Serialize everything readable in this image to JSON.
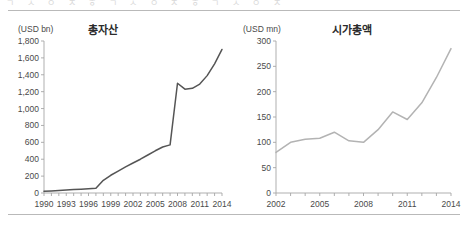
{
  "page": {
    "ghost_top_text": "ㄱ ㅅ ㅇ ㅈ ㅎ ㄱ ㅅ ㅇ ㅈ ㅎ ㄱ ㅅ ㅇ ㅈ"
  },
  "chart_data": [
    {
      "type": "line",
      "title": "총자산",
      "unit_label": "(USD bn)",
      "xlabel": "",
      "ylabel": "",
      "ylim": [
        0,
        1800
      ],
      "yticks": [
        0,
        200,
        400,
        600,
        800,
        1000,
        1200,
        1400,
        1600,
        1800
      ],
      "ytick_labels": [
        "0",
        "200",
        "400",
        "600",
        "800",
        "1,000",
        "1,200",
        "1,400",
        "1,600",
        "1,800"
      ],
      "xlim": [
        1990,
        2014
      ],
      "xticks": [
        1990,
        1993,
        1996,
        1999,
        2002,
        2005,
        2008,
        2011,
        2014
      ],
      "xtick_labels": [
        "1990",
        "1993",
        "1996",
        "1999",
        "2002",
        "2005",
        "2008",
        "2011",
        "2014"
      ],
      "grid": false,
      "legend": "none",
      "line_color": "#555555",
      "x": [
        1990,
        1991,
        1992,
        1993,
        1994,
        1995,
        1996,
        1997,
        1998,
        1999,
        2000,
        2001,
        2002,
        2003,
        2004,
        2005,
        2006,
        2007,
        2008,
        2009,
        2010,
        2011,
        2012,
        2013,
        2014
      ],
      "values": [
        20,
        25,
        30,
        35,
        40,
        45,
        50,
        55,
        150,
        210,
        260,
        310,
        355,
        400,
        450,
        500,
        545,
        570,
        1300,
        1230,
        1240,
        1290,
        1390,
        1530,
        1700
      ]
    },
    {
      "type": "line",
      "title": "시가총액",
      "unit_label": "(USD mn)",
      "xlabel": "",
      "ylabel": "",
      "ylim": [
        0,
        300
      ],
      "yticks": [
        0,
        50,
        100,
        150,
        200,
        250,
        300
      ],
      "ytick_labels": [
        "0",
        "50",
        "100",
        "150",
        "200",
        "250",
        "300"
      ],
      "xlim": [
        2002,
        2014
      ],
      "xticks": [
        2002,
        2005,
        2008,
        2011,
        2014
      ],
      "xtick_labels": [
        "2002",
        "2005",
        "2008",
        "2011",
        "2014"
      ],
      "grid": false,
      "legend": "none",
      "line_color": "#b3b3b3",
      "x": [
        2002,
        2003,
        2004,
        2005,
        2006,
        2007,
        2008,
        2009,
        2010,
        2011,
        2012,
        2013,
        2014
      ],
      "values": [
        80,
        100,
        106,
        108,
        120,
        103,
        100,
        125,
        160,
        145,
        178,
        228,
        285
      ]
    }
  ]
}
